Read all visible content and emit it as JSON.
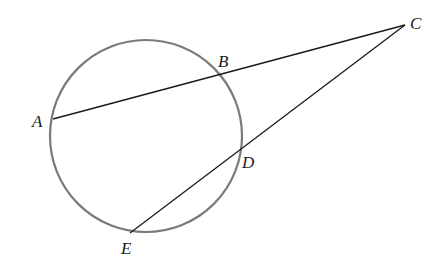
{
  "diagram": {
    "type": "circle-secants",
    "colors": {
      "circle": "#7a7a7a",
      "lines": "#1a1a1a",
      "labels": "#1a1a1a",
      "background": "#ffffff"
    },
    "circle": {
      "cx": 146,
      "cy": 136,
      "r": 96
    },
    "points": {
      "A": {
        "label": "A",
        "x": 53,
        "y": 119,
        "lx": 32,
        "ly": 127
      },
      "B": {
        "label": "B",
        "x": 219,
        "y": 75,
        "lx": 218,
        "ly": 67
      },
      "C": {
        "label": "C",
        "x": 405,
        "y": 25,
        "lx": 410,
        "ly": 29
      },
      "D": {
        "label": "D",
        "x": 240,
        "y": 149,
        "lx": 242,
        "ly": 168
      },
      "E": {
        "label": "E",
        "x": 130,
        "y": 233,
        "lx": 121,
        "ly": 254
      }
    },
    "segments": [
      {
        "from": "A",
        "to": "C"
      },
      {
        "from": "E",
        "to": "C"
      }
    ]
  }
}
